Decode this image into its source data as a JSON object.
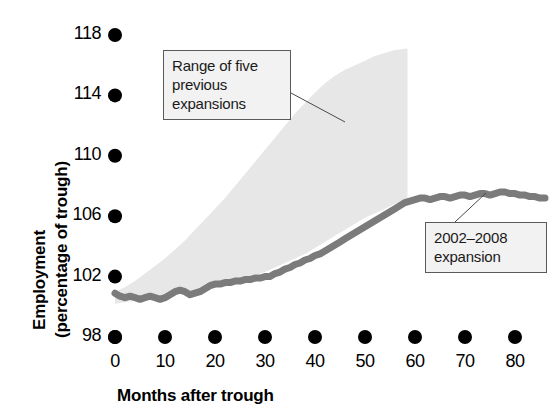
{
  "chart_data": {
    "type": "area",
    "title": "",
    "xlabel": "Months after trough",
    "ylabel": "Employment (percentage of trough)",
    "xlim": [
      0,
      80
    ],
    "ylim": [
      98,
      118
    ],
    "xticks": [
      "0",
      "10",
      "20",
      "30",
      "40",
      "50",
      "60",
      "70",
      "80"
    ],
    "yticks": [
      "118",
      "114",
      "110",
      "106",
      "102",
      "98"
    ],
    "grid": false,
    "legend_position": "annotations",
    "marker_style": "filled-circle-ticks",
    "annotations": [
      {
        "id": "range-band",
        "text_lines": [
          "Range of five",
          "previous",
          "expansions"
        ],
        "text": "Range of five previous expansions",
        "points_to_x": 34,
        "points_to_y": 110.5
      },
      {
        "id": "expansion-line",
        "text_lines": [
          "2002–2008",
          "expansion"
        ],
        "text": "2002–2008 expansion",
        "points_to_x": 65,
        "points_to_y": 107.3
      }
    ],
    "series": [
      {
        "name": "Range of five previous expansions",
        "type": "band",
        "color": "#e7e7e7",
        "x": [
          0,
          2,
          4,
          6,
          8,
          10,
          12,
          14,
          16,
          18,
          20,
          22,
          24,
          26,
          28,
          30,
          32,
          34,
          36,
          38,
          40,
          42,
          44,
          46,
          48,
          50,
          52,
          54,
          56,
          58.5
        ],
        "upper": [
          101.0,
          101.3,
          101.7,
          102.2,
          102.7,
          103.2,
          103.8,
          104.4,
          105.1,
          105.8,
          106.5,
          107.2,
          108.0,
          108.8,
          109.6,
          110.4,
          111.2,
          112.0,
          112.8,
          113.5,
          114.2,
          114.8,
          115.3,
          115.7,
          116.0,
          116.3,
          116.6,
          116.8,
          117.0,
          117.1
        ],
        "lower": [
          100.2,
          100.3,
          100.4,
          100.5,
          100.6,
          100.7,
          100.8,
          101.0,
          101.1,
          101.2,
          101.4,
          101.5,
          101.7,
          101.9,
          102.1,
          102.3,
          102.6,
          102.9,
          103.2,
          103.5,
          103.9,
          104.3,
          104.7,
          105.1,
          105.5,
          105.9,
          106.2,
          106.5,
          106.8,
          107.0
        ]
      },
      {
        "name": "2002–2008 expansion",
        "type": "line",
        "color": "#7b7b7b",
        "line_width": 7,
        "x": [
          0,
          1,
          2,
          3,
          4,
          5,
          6,
          7,
          8,
          9,
          10,
          11,
          12,
          13,
          14,
          15,
          16,
          17,
          18,
          19,
          20,
          21,
          22,
          23,
          24,
          25,
          26,
          27,
          28,
          29,
          30,
          31,
          32,
          33,
          34,
          35,
          36,
          37,
          38,
          39,
          40,
          41,
          42,
          43,
          44,
          45,
          46,
          47,
          48,
          49,
          50,
          51,
          52,
          53,
          54,
          55,
          56,
          57,
          58,
          59,
          60,
          61,
          62,
          63,
          64,
          65,
          66,
          67,
          68,
          69,
          70,
          71,
          72,
          73,
          74,
          75,
          76,
          77,
          78,
          79,
          80,
          81,
          82,
          83,
          84,
          85,
          86
        ],
        "y": [
          100.9,
          100.7,
          100.6,
          100.7,
          100.6,
          100.5,
          100.6,
          100.7,
          100.6,
          100.5,
          100.6,
          100.8,
          101.0,
          101.1,
          101.0,
          100.8,
          100.9,
          101.0,
          101.2,
          101.4,
          101.5,
          101.5,
          101.6,
          101.6,
          101.7,
          101.7,
          101.8,
          101.8,
          101.9,
          101.9,
          102.0,
          102.0,
          102.2,
          102.3,
          102.5,
          102.6,
          102.8,
          102.9,
          103.1,
          103.2,
          103.4,
          103.5,
          103.7,
          103.9,
          104.1,
          104.3,
          104.5,
          104.7,
          104.9,
          105.1,
          105.3,
          105.5,
          105.7,
          105.9,
          106.1,
          106.3,
          106.5,
          106.7,
          106.9,
          107.0,
          107.1,
          107.2,
          107.2,
          107.1,
          107.2,
          107.3,
          107.3,
          107.2,
          107.3,
          107.4,
          107.4,
          107.3,
          107.4,
          107.5,
          107.5,
          107.4,
          107.5,
          107.6,
          107.6,
          107.5,
          107.5,
          107.4,
          107.4,
          107.3,
          107.3,
          107.2,
          107.2
        ]
      }
    ]
  }
}
